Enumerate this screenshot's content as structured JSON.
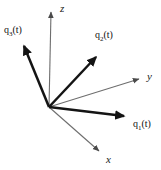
{
  "figure": {
    "background_color": "#ffffff",
    "width": 161,
    "height": 170,
    "origin": {
      "x": 49,
      "y": 107
    }
  },
  "axes": {
    "color": "#6e6e6e",
    "stroke_width": 1,
    "items": [
      {
        "name": "z-axis",
        "label": "z",
        "label_x": 60,
        "label_y": 4,
        "from": {
          "x": 49,
          "y": 107
        },
        "to": {
          "x": 51,
          "y": 9
        }
      },
      {
        "name": "y-axis",
        "label": "y",
        "label_x": 147,
        "label_y": 72,
        "from": {
          "x": 49,
          "y": 107
        },
        "to": {
          "x": 143,
          "y": 78
        }
      },
      {
        "name": "x-axis",
        "label": "x",
        "label_x": 106,
        "label_y": 155,
        "from": {
          "x": 49,
          "y": 107
        },
        "to": {
          "x": 103,
          "y": 155
        }
      }
    ]
  },
  "vectors": {
    "color": "#141414",
    "stroke_width": 2.4,
    "items": [
      {
        "name": "vector-q1",
        "label_base": "q",
        "label_sub": "1",
        "label_tail": "(t)",
        "label_x": 133,
        "label_y": 120,
        "from": {
          "x": 49,
          "y": 107
        },
        "to": {
          "x": 130,
          "y": 117
        }
      },
      {
        "name": "vector-q2",
        "label_base": "q",
        "label_sub": "2",
        "label_tail": "(t)",
        "label_x": 95,
        "label_y": 31,
        "from": {
          "x": 49,
          "y": 107
        },
        "to": {
          "x": 100,
          "y": 52
        }
      },
      {
        "name": "vector-q3",
        "label_base": "q",
        "label_sub": "3",
        "label_tail": "(t)",
        "label_x": 4,
        "label_y": 26,
        "from": {
          "x": 49,
          "y": 107
        },
        "to": {
          "x": 21,
          "y": 41
        }
      }
    ]
  }
}
